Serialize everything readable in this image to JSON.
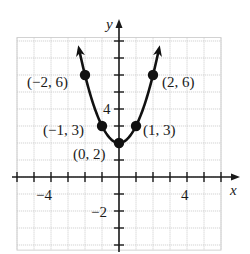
{
  "chart_data": {
    "type": "line",
    "title": "",
    "function": "y = x^2 + 2",
    "xlabel": "x",
    "ylabel": "y",
    "xlim": [
      -6,
      6
    ],
    "ylim": [
      -4.3,
      8.2
    ],
    "grid": true,
    "x_tick_labels": [
      {
        "value": -4,
        "label": "−4"
      },
      {
        "value": 4,
        "label": "4"
      }
    ],
    "y_tick_labels": [
      {
        "value": 4,
        "label": "4"
      },
      {
        "value": -2,
        "label": "−2"
      }
    ],
    "series": [
      {
        "name": "parabola",
        "x_range": [
          -2.35,
          2.35
        ],
        "points": [
          {
            "x": -2,
            "y": 6,
            "label": "(−2, 6)"
          },
          {
            "x": -1,
            "y": 3,
            "label": "(−1, 3)"
          },
          {
            "x": 0,
            "y": 2,
            "label": "(0, 2)"
          },
          {
            "x": 1,
            "y": 3,
            "label": "(1, 3)"
          },
          {
            "x": 2,
            "y": 6,
            "label": "(2, 6)"
          }
        ]
      }
    ]
  },
  "colors": {
    "grid": "#c8c8c8",
    "axis": "#1a1a1a",
    "curve": "#111111"
  }
}
